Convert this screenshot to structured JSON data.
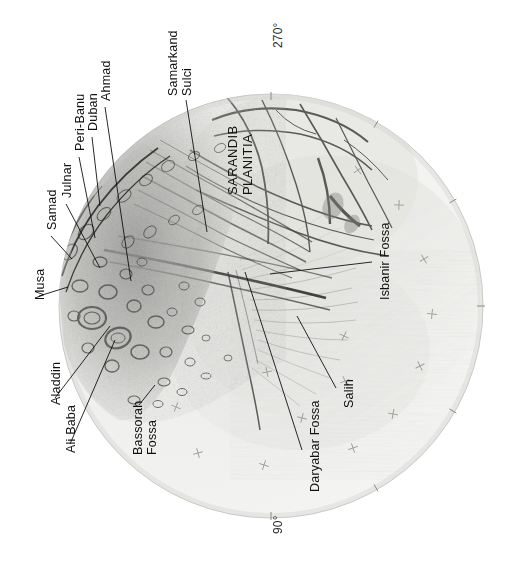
{
  "figure": {
    "name": "enceladus-leading-hemisphere-map",
    "body_subtitle": "",
    "background_color": "#ffffff",
    "disc_color_light": "#f2f2f0",
    "disc_color_mid": "#d8d8d4",
    "disc_outline_color": "#b9b9b5",
    "ink_color": "#111111"
  },
  "projection": {
    "center_x": 271,
    "center_y": 306,
    "radius": 212,
    "shape": "circle"
  },
  "meridians": [
    {
      "label": "270°",
      "x": 272,
      "y": 48,
      "position": "top"
    },
    {
      "label": "90°",
      "x": 272,
      "y": 534,
      "position": "bottom"
    }
  ],
  "labels": [
    {
      "id": "samarkand-sulci",
      "text_lines": [
        "Samarkand",
        "Sulci"
      ],
      "x": 166,
      "y": 96,
      "class": "twoline",
      "leader": {
        "x1": 186,
        "y1": 100,
        "x2": 207,
        "y2": 232
      }
    },
    {
      "id": "ahmad",
      "text_lines": [
        "Ahmad"
      ],
      "x": 99,
      "y": 101,
      "leader": {
        "x1": 105,
        "y1": 107,
        "x2": 131,
        "y2": 281
      }
    },
    {
      "id": "duban",
      "text_lines": [
        "Duban"
      ],
      "x": 86,
      "y": 131,
      "leader": {
        "x1": 92,
        "y1": 137,
        "x2": 100,
        "y2": 206
      }
    },
    {
      "id": "peri-banu",
      "text_lines": [
        "Peri-Banu"
      ],
      "x": 73,
      "y": 151,
      "leader": {
        "x1": 79,
        "y1": 157,
        "x2": 95,
        "y2": 238
      }
    },
    {
      "id": "julnar",
      "text_lines": [
        "Julnar"
      ],
      "x": 60,
      "y": 198,
      "leader": {
        "x1": 66,
        "y1": 204,
        "x2": 100,
        "y2": 268
      }
    },
    {
      "id": "samad",
      "text_lines": [
        "Samad"
      ],
      "x": 45,
      "y": 230,
      "leader": {
        "x1": 51,
        "y1": 236,
        "x2": 72,
        "y2": 259
      }
    },
    {
      "id": "musa",
      "text_lines": [
        "Musa"
      ],
      "x": 33,
      "y": 300,
      "leader": {
        "x1": 39,
        "y1": 296,
        "x2": 68,
        "y2": 287
      }
    },
    {
      "id": "aladdin",
      "text_lines": [
        "Aladdin"
      ],
      "x": 49,
      "y": 405,
      "leader": {
        "x1": 55,
        "y1": 398,
        "x2": 110,
        "y2": 326
      }
    },
    {
      "id": "ali-baba",
      "text_lines": [
        "Ali Baba"
      ],
      "x": 64,
      "y": 453,
      "leader": {
        "x1": 70,
        "y1": 444,
        "x2": 115,
        "y2": 340
      }
    },
    {
      "id": "bassorah-fossa",
      "text_lines": [
        "Bassorah",
        "Fossa"
      ],
      "x": 131,
      "y": 455,
      "class": "twoline",
      "leader": {
        "x1": 139,
        "y1": 405,
        "x2": 155,
        "y2": 385
      }
    },
    {
      "id": "daryabar-fossa",
      "text_lines": [
        "Daryabar Fossa"
      ],
      "x": 308,
      "y": 492,
      "leader": {
        "x1": 302,
        "y1": 450,
        "x2": 245,
        "y2": 272
      }
    },
    {
      "id": "salih",
      "text_lines": [
        "Salih"
      ],
      "x": 342,
      "y": 408,
      "leader": {
        "x1": 336,
        "y1": 388,
        "x2": 297,
        "y2": 316
      }
    },
    {
      "id": "isbanir-fossa",
      "text_lines": [
        "Isbanir Fossa"
      ],
      "x": 378,
      "y": 300,
      "leader": {
        "x1": 372,
        "y1": 262,
        "x2": 270,
        "y2": 274
      }
    },
    {
      "id": "sarandib-planitia",
      "text_lines": [
        "SARANDIB",
        "PLANITIA"
      ],
      "x": 226,
      "y": 195,
      "class": "twoline planitia",
      "leader": null
    }
  ],
  "graticule_marks": [
    {
      "x": 358,
      "y": 170
    },
    {
      "x": 399,
      "y": 205
    },
    {
      "x": 424,
      "y": 259
    },
    {
      "x": 432,
      "y": 314
    },
    {
      "x": 420,
      "y": 366
    },
    {
      "x": 393,
      "y": 414
    },
    {
      "x": 345,
      "y": 381
    },
    {
      "x": 302,
      "y": 418
    },
    {
      "x": 353,
      "y": 448
    },
    {
      "x": 264,
      "y": 465
    },
    {
      "x": 198,
      "y": 453
    },
    {
      "x": 176,
      "y": 407
    },
    {
      "x": 267,
      "y": 372
    },
    {
      "x": 344,
      "y": 336
    }
  ],
  "edge_ticks": [
    {
      "angle_deg": 0
    },
    {
      "angle_deg": 30
    },
    {
      "angle_deg": 60
    },
    {
      "angle_deg": 90
    },
    {
      "angle_deg": 120
    },
    {
      "angle_deg": 150
    },
    {
      "angle_deg": 180
    }
  ]
}
